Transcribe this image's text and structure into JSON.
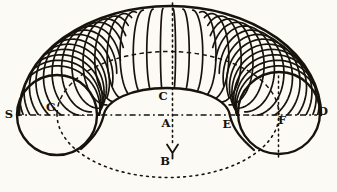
{
  "figure": {
    "title_semantic": "anchor-ring-torus-diagram",
    "background": "#fbfaf5",
    "ink": "#17130c",
    "labels": [
      {
        "id": "S",
        "text": "S",
        "x": 9,
        "y": 115
      },
      {
        "id": "G",
        "text": "G",
        "x": 51,
        "y": 108
      },
      {
        "id": "C",
        "text": "C",
        "x": 163,
        "y": 97
      },
      {
        "id": "A",
        "text": "A",
        "x": 166,
        "y": 124
      },
      {
        "id": "E",
        "text": "E",
        "x": 227,
        "y": 125
      },
      {
        "id": "F",
        "text": "F",
        "x": 282,
        "y": 121
      },
      {
        "id": "D",
        "text": "D",
        "x": 323,
        "y": 112
      },
      {
        "id": "B",
        "text": "B",
        "x": 165,
        "y": 162
      }
    ],
    "label_font_px": 11.5,
    "geometry": {
      "width": 337,
      "height": 192,
      "outer": {
        "cx": 170,
        "cy": 115,
        "rx": 151,
        "ry": 109
      },
      "spine": {
        "cx": 168,
        "cy": 114.5,
        "rx": 111,
        "ry": 63
      },
      "left_circle": {
        "cx": 57,
        "cy": 115,
        "r": 40
      },
      "right_circle": {
        "cx": 279,
        "cy": 113,
        "r": 41
      },
      "inner": {
        "cx": 167,
        "top_y": 88,
        "left_x": 103.5,
        "right_x": 230,
        "base_y": 116,
        "flare_left": [
          81,
          149
        ],
        "flare_right": [
          254,
          150
        ]
      },
      "tube": {
        "a_max": 42,
        "b": 43
      },
      "meridian_count": 34,
      "center_axis": {
        "x": 172.5,
        "y1": 3,
        "y2": 145
      },
      "arrow": {
        "tip_x": 172.5,
        "tip_y": 153,
        "arm_dx": 5.5,
        "arm_dy": 8.5,
        "stem_y2": 158.5
      },
      "f_axis": {
        "x": 278.5,
        "y1": 76,
        "y2": 157
      },
      "h_axis": {
        "y": 115,
        "x1": 16,
        "x2": 317
      }
    },
    "stroke": {
      "outline_w": 2.6,
      "circle_w": 2.4,
      "inner_w": 2.3,
      "hatch_w": 1.7,
      "dash_w": 1.6,
      "h_dasharray": "6 3.2 1.8 3.2",
      "dot_dasharray": "1.7 3.6",
      "spine_top_dasharray": "4.5 3.4",
      "spine_bottom_dasharray": "1.8 4.4"
    }
  }
}
